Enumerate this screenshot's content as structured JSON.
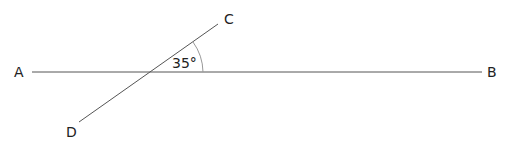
{
  "diagram": {
    "type": "intersecting-lines",
    "labels": {
      "A": "A",
      "B": "B",
      "C": "C",
      "D": "D"
    },
    "angle": {
      "text": "35°",
      "value_degrees": 35,
      "between": [
        "C",
        "B"
      ]
    },
    "colors": {
      "line": "#555555",
      "arc": "#999999",
      "text": "#222222"
    }
  }
}
